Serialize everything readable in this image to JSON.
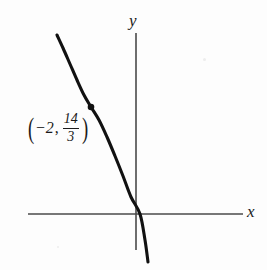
{
  "figure": {
    "width": 267,
    "height": 270,
    "background_color": "#fdfdfd",
    "ink_color": "#1a1a1a",
    "curve_color": "#111111",
    "axis_color": "#4a4a4a"
  },
  "axes": {
    "x_label": "x",
    "y_label": "y",
    "x_axis": {
      "x1": 28,
      "y1": 214,
      "x2": 243,
      "y2": 214
    },
    "y_axis": {
      "x1": 136,
      "y1": 33,
      "x2": 136,
      "y2": 250
    },
    "origin": {
      "x": 136,
      "y": 214
    }
  },
  "annotation": {
    "open_paren": "(",
    "close_paren": ")",
    "x_value": "−2",
    "comma": ",",
    "fraction_numerator": "14",
    "fraction_denominator": "3",
    "full_text": "(−2, 14/3)"
  },
  "chart_data": {
    "type": "line",
    "title": "",
    "xlabel": "x",
    "ylabel": "y",
    "grid": false,
    "legend": null,
    "annotations": [
      {
        "label": "(−2, 14/3)",
        "x": -2,
        "y": 4.6667,
        "marker": "filled-dot",
        "marker_pixel": {
          "x": 91,
          "y": 107
        },
        "label_pixel": {
          "x": 68,
          "y": 133
        }
      }
    ],
    "series": [
      {
        "name": "curve",
        "description": "decreasing cubic-like curve with inflection at the marked point",
        "x_intercept": 0.15,
        "points_pixel": [
          {
            "x": 57,
            "y": 35
          },
          {
            "x": 63,
            "y": 48
          },
          {
            "x": 70,
            "y": 64
          },
          {
            "x": 77,
            "y": 80
          },
          {
            "x": 84,
            "y": 95
          },
          {
            "x": 91,
            "y": 107
          },
          {
            "x": 99,
            "y": 120
          },
          {
            "x": 107,
            "y": 137
          },
          {
            "x": 115,
            "y": 156
          },
          {
            "x": 123,
            "y": 176
          },
          {
            "x": 131,
            "y": 197
          },
          {
            "x": 140,
            "y": 214
          },
          {
            "x": 145,
            "y": 240
          },
          {
            "x": 148,
            "y": 262
          }
        ]
      }
    ]
  }
}
